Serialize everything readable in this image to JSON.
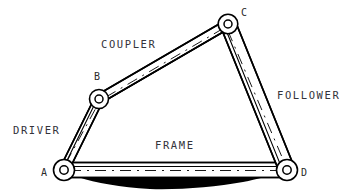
{
  "diagram": {
    "background_color": "#ffffff",
    "line_color": "#000000",
    "label_color": "#33333a",
    "joints": [
      {
        "id": "A",
        "label": "A",
        "x": 64,
        "y": 170,
        "label_x": 41,
        "label_y": 176
      },
      {
        "id": "B",
        "label": "B",
        "x": 99,
        "y": 99,
        "label_x": 94,
        "label_y": 80
      },
      {
        "id": "C",
        "label": "C",
        "x": 228,
        "y": 24,
        "label_x": 241,
        "label_y": 16
      },
      {
        "id": "D",
        "label": "D",
        "x": 287,
        "y": 170,
        "label_x": 301,
        "label_y": 176
      }
    ],
    "links": [
      {
        "id": "driver",
        "label": "DRIVER",
        "from": "A",
        "to": "B",
        "label_x": 13,
        "label_y": 134
      },
      {
        "id": "coupler",
        "label": "COUPLER",
        "from": "B",
        "to": "C",
        "label_x": 101,
        "label_y": 48
      },
      {
        "id": "follower",
        "label": "FOLLOWER",
        "from": "C",
        "to": "D",
        "label_x": 277,
        "label_y": 99
      },
      {
        "id": "frame",
        "label": "FRAME",
        "from": "A",
        "to": "D",
        "label_x": 155,
        "label_y": 149
      }
    ],
    "ground": {
      "name": "ground-shadow",
      "description": "solid black ground hatching beneath frame"
    }
  }
}
